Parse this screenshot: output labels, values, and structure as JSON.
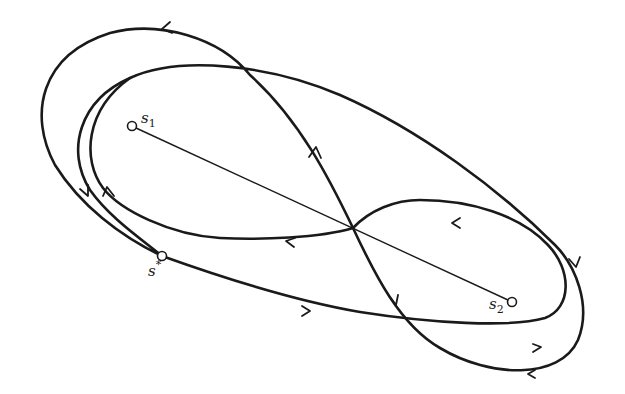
{
  "diagram": {
    "type": "phase-trajectory-diagram",
    "points": [
      {
        "id": "s1",
        "label": "s",
        "subscript": "1",
        "x": 132,
        "y": 126
      },
      {
        "id": "s2",
        "label": "s",
        "subscript": "2",
        "x": 512,
        "y": 302
      },
      {
        "id": "s_star",
        "label": "s",
        "superscript": "*",
        "x": 162,
        "y": 256
      }
    ],
    "segment": {
      "from": "s1",
      "to": "s2"
    },
    "curves": [
      {
        "id": "outer-loop",
        "description": "figure-eight trajectory passing through s*"
      },
      {
        "id": "inner-loop",
        "description": "inner closed trajectory"
      }
    ],
    "crossing_point": {
      "x": 353,
      "y": 228
    }
  }
}
